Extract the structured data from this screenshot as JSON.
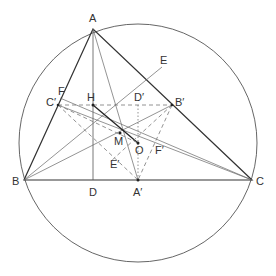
{
  "diagram": {
    "labels": {
      "A": "A",
      "B": "B",
      "C": "C",
      "D": "D",
      "E": "E",
      "F": "F",
      "H": "H",
      "M": "M",
      "O": "O",
      "A_prime": "A′",
      "B_prime": "B′",
      "C_prime": "C′",
      "D_prime": "D′",
      "E_prime": "E′",
      "F_prime": "F′"
    },
    "points": {
      "A": [
        93,
        29
      ],
      "B": [
        24,
        180
      ],
      "C": [
        252,
        180
      ],
      "D": [
        93,
        180
      ],
      "H": [
        93,
        105
      ],
      "M": [
        120,
        133
      ],
      "O": [
        138,
        143
      ],
      "A_prime": [
        138,
        180
      ],
      "B_prime": [
        172,
        105
      ],
      "C_prime": [
        58,
        105
      ],
      "D_prime": [
        138,
        105
      ],
      "E": [
        162,
        67
      ],
      "F": [
        60,
        98
      ],
      "E_prime": [
        124,
        160
      ],
      "F_prime": [
        160,
        146
      ]
    },
    "circle": {
      "cx": 138,
      "cy": 143,
      "r": 119
    },
    "colors": {
      "stroke": "#333333",
      "thin": "#666666",
      "label": "#333333"
    }
  }
}
